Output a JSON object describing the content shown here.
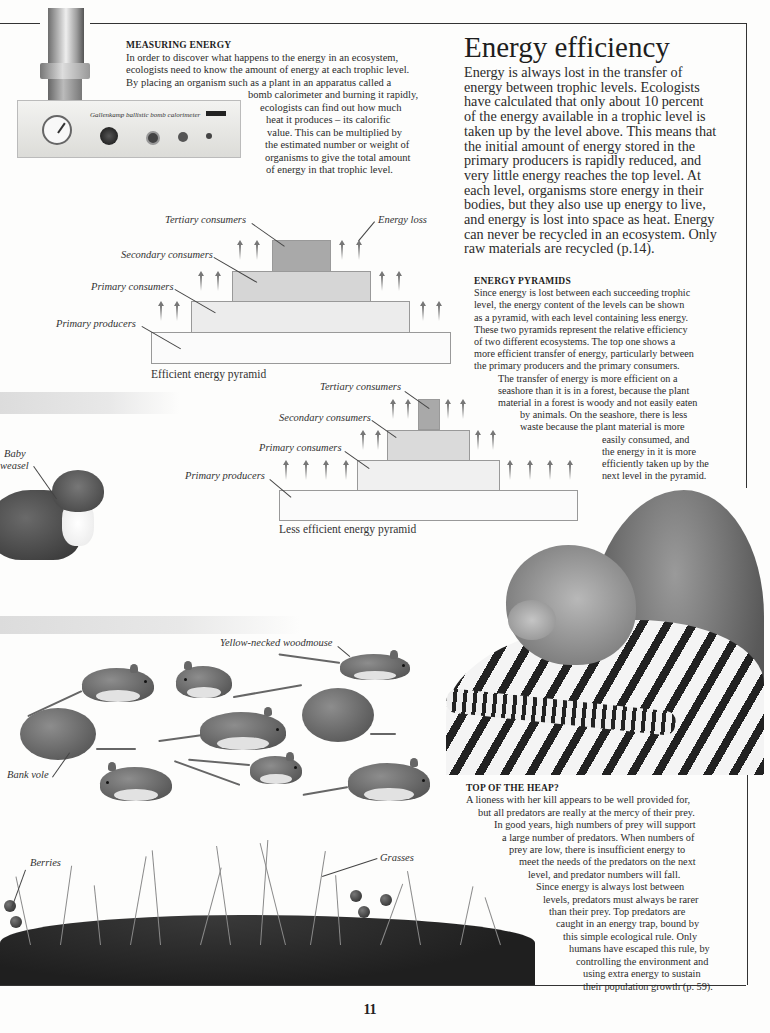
{
  "page": {
    "number": "11",
    "title": "Energy efficiency",
    "intro": [
      "Energy is always lost in the transfer of",
      "energy between trophic levels. Ecologists",
      "have calculated that only about 10 percent",
      "of the energy available in a trophic level is",
      "taken up by the level above. This means that",
      "the initial amount of energy stored in the",
      "primary producers is rapidly reduced, and",
      "very little energy reaches the top level. At",
      "each level, organisms store energy in their",
      "bodies, but they also use up energy to live,",
      "and energy is lost into space as heat. Energy",
      "can never be recycled in an ecosystem. Only",
      "raw materials are recycled (p.14)."
    ]
  },
  "measuring_energy": {
    "heading": "MEASURING ENERGY",
    "lines": [
      "In order to discover what happens to the energy in an ecosystem,",
      "ecologists need to know the amount of energy at each trophic level.",
      "By placing an organism such as a plant in an apparatus called a",
      "bomb calorimeter and burning it rapidly,",
      "ecologists can find out how much",
      "heat it produces – its calorific",
      "value. This can be multiplied by",
      "the estimated number or weight of",
      "organisms to give the total amount",
      "of energy in that trophic level."
    ],
    "device_brand": "Gallenkamp  ballistic bomb calorimeter"
  },
  "energy_pyramids": {
    "heading": "ENERGY PYRAMIDS",
    "lines": [
      "Since energy is lost between each succeeding trophic",
      "level, the energy content of the levels can be shown",
      "as a pyramid, with each level containing less energy.",
      "These two pyramids represent the relative efficiency",
      "of two different ecosystems. The top one shows a",
      "more efficient transfer of energy, particularly between",
      "the primary producers and the primary consumers.",
      "The transfer of energy is more efficient on a",
      "seashore than it is in a forest, because the plant",
      "material in a forest is woody and not easily eaten",
      "by animals. On the seashore, there is less",
      "waste because the plant material is more",
      "easily consumed, and",
      "the energy in it is more",
      "efficiently taken up by the",
      "next level in the pyramid."
    ]
  },
  "pyramid_efficient": {
    "caption": "Efficient energy pyramid",
    "labels": {
      "tertiary": "Tertiary consumers",
      "secondary": "Secondary consumers",
      "primary_consumers": "Primary consumers",
      "primary_producers": "Primary producers",
      "energy_loss": "Energy loss"
    }
  },
  "pyramid_less": {
    "caption": "Less efficient energy pyramid",
    "labels": {
      "tertiary": "Tertiary consumers",
      "secondary": "Secondary consumers",
      "primary_consumers": "Primary consumers",
      "primary_producers": "Primary producers"
    }
  },
  "animal_labels": {
    "weasel_1": "Baby",
    "weasel_2": "weasel",
    "woodmouse": "Yellow-necked woodmouse",
    "bank_vole": "Bank vole",
    "berries": "Berries",
    "grasses": "Grasses"
  },
  "top_of_heap": {
    "heading": "TOP OF THE HEAP?",
    "lines": [
      "A lioness with her kill appears to be well provided for,",
      "but all predators are really at the mercy of their prey.",
      "In good years, high numbers of prey will support",
      "a large number of predators. When numbers of",
      "prey are low, there is insufficient energy to",
      "meet the needs of the predators on the next",
      "level, and predator numbers will fall.",
      "Since energy is always lost between",
      "levels, predators must always be rarer",
      "than their prey. Top predators are",
      "caught in an energy trap, bound by",
      "this simple ecological rule. Only",
      "humans have escaped this rule, by",
      "controlling the environment and",
      "using extra energy to sustain",
      "their population growth (p. 59)."
    ]
  }
}
